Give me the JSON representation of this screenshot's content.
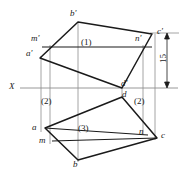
{
  "drawing": {
    "title": "Orthographic projection of an oblique plane solid",
    "axis_label": "X",
    "dimension": {
      "value": "15",
      "unit": ""
    },
    "colors": {
      "outline": "#1a1a1a",
      "projection_line": "#8d8d8d",
      "axis_line": "#8d8d8d",
      "background": "#ffffff"
    },
    "face_labels": [
      {
        "id": "face-1",
        "text": "(1)",
        "x": 82,
        "y": 39
      },
      {
        "id": "face-2-left",
        "text": "(2)",
        "x": 41,
        "y": 98
      },
      {
        "id": "face-2-right",
        "text": "(2)",
        "x": 134,
        "y": 98
      },
      {
        "id": "face-3",
        "text": "(3)",
        "x": 79,
        "y": 125
      }
    ],
    "vertex_labels": [
      {
        "id": "b-prime",
        "text": "b'",
        "x": 70,
        "y": 9
      },
      {
        "id": "m-prime",
        "text": "m'",
        "x": 31,
        "y": 34
      },
      {
        "id": "n-prime",
        "text": "n'",
        "x": 135,
        "y": 34
      },
      {
        "id": "c-prime",
        "text": "c'",
        "x": 156,
        "y": 27
      },
      {
        "id": "a-prime",
        "text": "a'",
        "x": 27,
        "y": 49
      },
      {
        "id": "d-prime",
        "text": "d'",
        "x": 121,
        "y": 81
      },
      {
        "id": "d",
        "text": "d",
        "x": 122,
        "y": 91
      },
      {
        "id": "a",
        "text": "a",
        "x": 33,
        "y": 124
      },
      {
        "id": "m",
        "text": "m",
        "x": 40,
        "y": 136
      },
      {
        "id": "n",
        "text": "n",
        "x": 139,
        "y": 127
      },
      {
        "id": "c",
        "text": "c",
        "x": 160,
        "y": 132
      },
      {
        "id": "b",
        "text": "b",
        "x": 73,
        "y": 160
      }
    ],
    "axis": {
      "label_x": 9,
      "label_y": 82,
      "line_y": 88,
      "x1": 20,
      "x2": 176
    },
    "dimension_label": {
      "text": "15",
      "x": 161,
      "y": 54
    }
  },
  "geometry": {
    "front_view_polygon": "78,22 152,34 122,88 40,58",
    "front_outline_top": "40,58 78,22 152,34",
    "front_outline_bottom": "40,58 122,88 152,34",
    "top_view_polygon": "45,128 122,97 157,138 78,160",
    "mn_front_line": "43,47 143,47",
    "mn_top_line": "52,141 143,133",
    "verticals": [
      {
        "name": "a-vertical",
        "x": 41,
        "y1": 58,
        "y2": 131
      },
      {
        "name": "m-vertical",
        "x": 50,
        "y1": 47,
        "y2": 143
      },
      {
        "name": "b-vertical",
        "x": 78,
        "y1": 22,
        "y2": 162
      },
      {
        "name": "d-vertical",
        "x": 122,
        "y1": 88,
        "y2": 98
      },
      {
        "name": "n-vertical",
        "x": 143,
        "y1": 47,
        "y2": 134
      },
      {
        "name": "c-vertical",
        "x": 155,
        "y1": 34,
        "y2": 139
      }
    ],
    "dimension_line": {
      "x": 166,
      "y_top": 33,
      "y_bottom": 88
    },
    "extension_lines": [
      {
        "name": "upper-extension",
        "x1": 148,
        "y1": 33,
        "x2": 179,
        "y2": 33
      }
    ]
  }
}
